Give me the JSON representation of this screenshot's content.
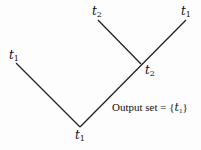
{
  "diagram": {
    "nodes": [
      {
        "id": "root",
        "var": "t",
        "sub": "1",
        "x": 75,
        "y": 129
      },
      {
        "id": "left-leaf",
        "var": "t",
        "sub": "1",
        "x": 9,
        "y": 49
      },
      {
        "id": "junction",
        "var": "t",
        "sub": "2",
        "x": 145,
        "y": 64
      },
      {
        "id": "top-left-leaf",
        "var": "t",
        "sub": "2",
        "x": 92,
        "y": 5
      },
      {
        "id": "top-right-leaf",
        "var": "t",
        "sub": "1",
        "x": 181,
        "y": 5
      }
    ],
    "edges": [
      {
        "from": "root",
        "to": "left-leaf",
        "x1": 80,
        "y1": 127,
        "x2": 16,
        "y2": 63
      },
      {
        "from": "root",
        "to": "top-right-leaf",
        "x1": 80,
        "y1": 127,
        "x2": 186,
        "y2": 20
      },
      {
        "from": "junction",
        "to": "top-left-leaf",
        "x1": 141,
        "y1": 64,
        "x2": 98,
        "y2": 20
      }
    ],
    "caption": {
      "prefix": "Output set = {",
      "var": "t",
      "sub": "1",
      "suffix": "}"
    }
  }
}
